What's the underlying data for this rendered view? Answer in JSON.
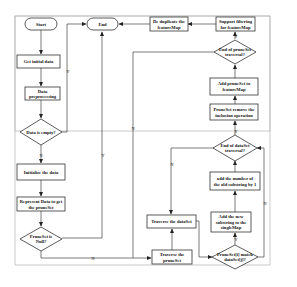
{
  "diagram": {
    "type": "flowchart",
    "nodes": {
      "start": "Start",
      "end": "End",
      "dedup_1": "De duplicate the",
      "dedup_2": "featureMap",
      "support_1": "Support filtering",
      "support_2": "for featureMap",
      "get_initial": "Get initial data",
      "preproc_1": "Data",
      "preproc_2": "preprocessing",
      "empty_q": "Data is empty?",
      "init": "Initialize the data",
      "represent_1": "Represent Data to get",
      "represent_2": "the pruneSet",
      "null_q_1": "PruneSet is",
      "null_q_2": "Null?",
      "trav_prune_1": "Traverse the",
      "trav_prune_2": "pruneSet",
      "trav_data": "Traverse the dataSet",
      "match_q_1": "PruneSet[i] match",
      "match_q_2": "dataSet[j]?",
      "add_new_1": "Add the new",
      "add_new_2": "substring to the",
      "add_new_3": "singleMap",
      "add_num_1": "add the number of",
      "add_num_2": "the old substring by 1",
      "end_data_q_1": "End of dataSet",
      "end_data_q_2": "traversal?",
      "remove_1": "PruneSet remove the",
      "remove_2": "inclusion operation",
      "add_prune_1": "Add pruneSet to",
      "add_prune_2": "featureMap",
      "end_prune_q_1": "End of pruneSet",
      "end_prune_q_2": "traversal?"
    },
    "edge_labels": {
      "yes": "Y",
      "no": "N"
    }
  }
}
